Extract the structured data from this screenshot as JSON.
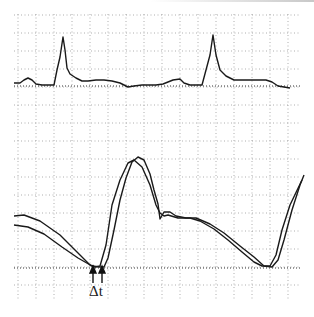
{
  "chart_data": {
    "type": "line",
    "title": "",
    "xlabel": "",
    "ylabel": "",
    "grid": true,
    "annotations": [
      {
        "text": "Δt",
        "x": 98,
        "y": 268,
        "arrows": 2
      }
    ],
    "series": [
      {
        "name": "ECG",
        "points": [
          [
            14,
            83
          ],
          [
            20,
            83
          ],
          [
            24,
            80
          ],
          [
            28,
            78
          ],
          [
            32,
            80
          ],
          [
            36,
            84
          ],
          [
            42,
            85
          ],
          [
            48,
            85
          ],
          [
            54,
            85
          ],
          [
            57,
            70
          ],
          [
            60,
            57
          ],
          [
            63,
            37
          ],
          [
            65,
            50
          ],
          [
            67,
            68
          ],
          [
            70,
            74
          ],
          [
            76,
            78
          ],
          [
            82,
            81
          ],
          [
            88,
            81
          ],
          [
            96,
            80
          ],
          [
            104,
            80
          ],
          [
            112,
            81
          ],
          [
            120,
            83
          ],
          [
            128,
            87
          ],
          [
            134,
            86
          ],
          [
            142,
            85
          ],
          [
            148,
            85
          ],
          [
            156,
            85
          ],
          [
            163,
            84
          ],
          [
            168,
            82
          ],
          [
            173,
            80
          ],
          [
            180,
            79
          ],
          [
            184,
            83
          ],
          [
            190,
            85
          ],
          [
            198,
            85
          ],
          [
            202,
            85
          ],
          [
            206,
            70
          ],
          [
            210,
            55
          ],
          [
            213,
            35
          ],
          [
            216,
            55
          ],
          [
            220,
            70
          ],
          [
            226,
            76
          ],
          [
            234,
            80
          ],
          [
            246,
            80
          ],
          [
            258,
            80
          ],
          [
            266,
            80
          ],
          [
            272,
            82
          ],
          [
            278,
            86
          ],
          [
            290,
            88
          ]
        ]
      },
      {
        "name": "Pressure-1",
        "points": [
          [
            14,
            216
          ],
          [
            24,
            215
          ],
          [
            40,
            221
          ],
          [
            60,
            235
          ],
          [
            75,
            250
          ],
          [
            90,
            265
          ],
          [
            95,
            267
          ],
          [
            100,
            266
          ],
          [
            106,
            245
          ],
          [
            112,
            205
          ],
          [
            120,
            180
          ],
          [
            128,
            163
          ],
          [
            134,
            160
          ],
          [
            142,
            167
          ],
          [
            150,
            185
          ],
          [
            156,
            205
          ],
          [
            160,
            213
          ],
          [
            164,
            216
          ],
          [
            168,
            215
          ],
          [
            178,
            218
          ],
          [
            190,
            218
          ],
          [
            200,
            221
          ],
          [
            214,
            229
          ],
          [
            228,
            240
          ],
          [
            242,
            252
          ],
          [
            254,
            262
          ],
          [
            262,
            266
          ],
          [
            270,
            266
          ],
          [
            276,
            255
          ],
          [
            282,
            230
          ],
          [
            290,
            205
          ],
          [
            302,
            180
          ]
        ]
      },
      {
        "name": "Pressure-2",
        "points": [
          [
            14,
            225
          ],
          [
            28,
            227
          ],
          [
            44,
            234
          ],
          [
            62,
            247
          ],
          [
            78,
            258
          ],
          [
            92,
            266
          ],
          [
            100,
            267
          ],
          [
            104,
            267
          ],
          [
            108,
            258
          ],
          [
            114,
            230
          ],
          [
            120,
            200
          ],
          [
            126,
            178
          ],
          [
            132,
            162
          ],
          [
            138,
            157
          ],
          [
            144,
            160
          ],
          [
            150,
            174
          ],
          [
            154,
            190
          ],
          [
            158,
            204
          ],
          [
            160,
            219
          ],
          [
            164,
            212
          ],
          [
            170,
            212
          ],
          [
            176,
            216
          ],
          [
            186,
            218
          ],
          [
            196,
            218
          ],
          [
            210,
            224
          ],
          [
            224,
            233
          ],
          [
            240,
            246
          ],
          [
            254,
            257
          ],
          [
            264,
            266
          ],
          [
            272,
            267
          ],
          [
            278,
            260
          ],
          [
            284,
            240
          ],
          [
            292,
            210
          ],
          [
            300,
            185
          ],
          [
            304,
            175
          ]
        ]
      }
    ],
    "xlim": [
      0,
      314
    ],
    "ylim": [
      0,
      317
    ]
  },
  "annotation": {
    "delta_t_label": "Δt"
  }
}
